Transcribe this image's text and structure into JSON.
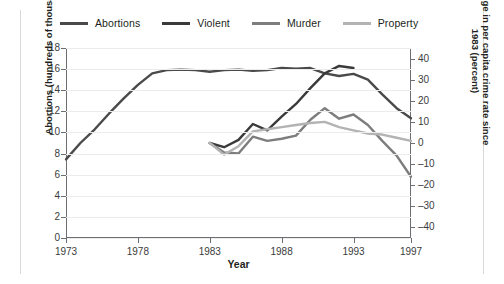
{
  "legend": {
    "items": [
      {
        "label": "Abortions",
        "color": "#4a4a4a"
      },
      {
        "label": "Violent",
        "color": "#3a3a3a"
      },
      {
        "label": "Murder",
        "color": "#7d7d7d"
      },
      {
        "label": "Property",
        "color": "#b3b3b3"
      }
    ]
  },
  "axes": {
    "x_title": "Year",
    "x_ticks": [
      "1973",
      "1978",
      "1983",
      "1988",
      "1993",
      "1997"
    ],
    "y_left_title": "Abortions (hundreds of thousands)",
    "y_left_ticks": [
      "18",
      "16",
      "14",
      "12",
      "10",
      "8",
      "6",
      "4",
      "2",
      "0"
    ],
    "y_right_title": "Change in per capita crime rate since 1983 (percent)",
    "y_right_ticks": [
      "40",
      "30",
      "20",
      "10",
      "0",
      "–10",
      "–20",
      "–30",
      "–40"
    ]
  },
  "chart_data": {
    "type": "line",
    "title": "",
    "xlabel": "Year",
    "ylabel": "Abortions (hundreds of thousands)",
    "y2label": "Change in per capita crime rate since 1983 (percent)",
    "xlim": [
      1973,
      1997
    ],
    "ylim": [
      0,
      18
    ],
    "y2lim": [
      -45,
      45
    ],
    "grid": true,
    "legend_position": "top",
    "series": [
      {
        "name": "Abortions",
        "axis": "left",
        "color": "#4a4a4a",
        "width": 2.4,
        "x": [
          1973,
          1974,
          1975,
          1976,
          1977,
          1978,
          1979,
          1980,
          1981,
          1982,
          1983,
          1984,
          1985,
          1986,
          1987,
          1988,
          1989,
          1990,
          1991,
          1992,
          1993,
          1994,
          1995,
          1996,
          1997
        ],
        "values": [
          7.45,
          9.0,
          10.3,
          11.8,
          13.2,
          14.5,
          15.6,
          15.9,
          15.95,
          15.9,
          15.75,
          15.9,
          15.95,
          15.85,
          15.9,
          16.1,
          16.05,
          16.1,
          15.6,
          15.35,
          15.55,
          15.0,
          13.6,
          12.3,
          11.35
        ]
      },
      {
        "name": "Violent",
        "axis": "right",
        "color": "#3a3a3a",
        "width": 2.4,
        "x": [
          1983,
          1984,
          1985,
          1986,
          1987,
          1988,
          1989,
          1990,
          1991,
          1992,
          1993
        ],
        "values": [
          0.0,
          -2.0,
          1.5,
          9.0,
          6.0,
          12.5,
          18.5,
          26.0,
          33.0,
          36.5,
          35.5
        ]
      },
      {
        "name": "Murder",
        "axis": "right",
        "color": "#7d7d7d",
        "width": 2.4,
        "x": [
          1983,
          1984,
          1985,
          1986,
          1987,
          1988,
          1989,
          1990,
          1991,
          1992,
          1993,
          1994,
          1995,
          1996,
          1997
        ],
        "values": [
          0.0,
          -4.5,
          -5.0,
          3.0,
          1.0,
          2.0,
          3.5,
          11.0,
          16.5,
          11.5,
          13.5,
          8.5,
          1.0,
          -6.0,
          -16.0
        ]
      },
      {
        "name": "Property",
        "axis": "right",
        "color": "#b3b3b3",
        "width": 2.4,
        "x": [
          1983,
          1984,
          1985,
          1986,
          1987,
          1988,
          1989,
          1990,
          1991,
          1992,
          1993,
          1994,
          1995,
          1996,
          1997
        ],
        "values": [
          0.0,
          -5.5,
          -1.5,
          5.5,
          6.5,
          7.5,
          8.5,
          9.5,
          10.0,
          7.5,
          6.0,
          4.5,
          4.0,
          2.5,
          1.0
        ]
      }
    ]
  }
}
